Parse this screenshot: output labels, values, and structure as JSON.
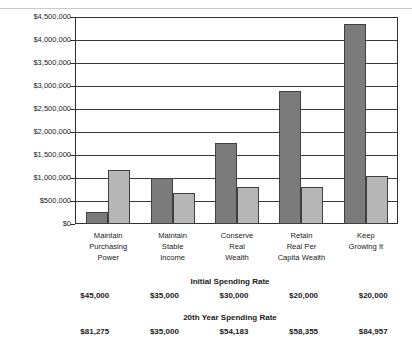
{
  "chart_data": {
    "type": "bar",
    "title": "",
    "xlabel": "",
    "ylabel": "",
    "ylim": [
      0,
      4500000
    ],
    "grid": true,
    "legend": "none",
    "ytick_labels": [
      "$4,500,000",
      "$4,000,000",
      "$3,500,000",
      "$3,000,000",
      "$2,500,000",
      "$2,000,000",
      "$1,500,000",
      "$1,000,000",
      "$500,000",
      "$0"
    ],
    "ytick_values": [
      4500000,
      4000000,
      3500000,
      3000000,
      2500000,
      2000000,
      1500000,
      1000000,
      500000,
      0
    ],
    "categories": [
      "Maintain Purchasing Power",
      "Maintain Stable Income",
      "Conserve Real Wealth",
      "Retain Real Per Capita Wealth",
      "Keep Growing It"
    ],
    "category_lines": [
      [
        "Maintain",
        "Purchasing",
        "Power"
      ],
      [
        "Maintain",
        "Stable",
        "Income"
      ],
      [
        "Conserve",
        "Real",
        "Wealth"
      ],
      [
        "Retain",
        "Real Per",
        "Capita Wealth"
      ],
      [
        "Keep",
        "Growing It"
      ]
    ],
    "series": [
      {
        "name": "dark",
        "color": "#7b7b7b",
        "values": [
          250000,
          1000000,
          1760000,
          2900000,
          4350000
        ]
      },
      {
        "name": "light",
        "color": "#b6b6b6",
        "values": [
          1175000,
          680000,
          800000,
          800000,
          1050000
        ]
      }
    ]
  },
  "rate_initial": {
    "title": "Initial Spending Rate",
    "values": [
      "$45,000",
      "$35,000",
      "$30,000",
      "$20,000",
      "$20,000"
    ]
  },
  "rate_20th": {
    "title": "20th Year Spending Rate",
    "values": [
      "$81,275",
      "$35,000",
      "$54,183",
      "$58,355",
      "$84,957"
    ]
  }
}
